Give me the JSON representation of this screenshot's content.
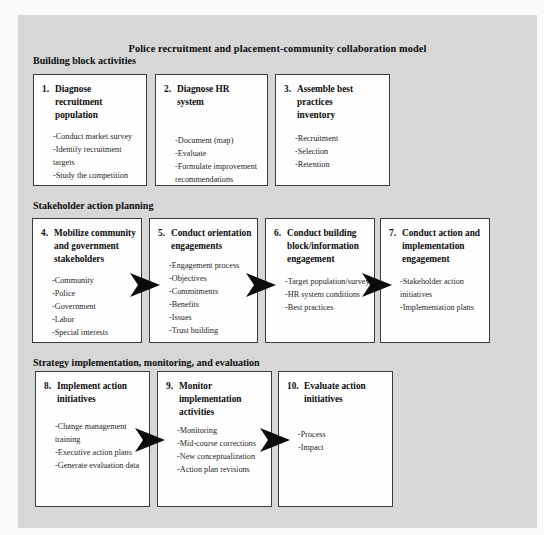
{
  "title": "Police recruitment and placement-community collaboration model",
  "colors": {
    "panel_bg": "#d7d7d7",
    "box_bg": "#fefefe",
    "border": "#3c3c3c",
    "arrow": "#0b0b0b",
    "title_text": "#0d0d0d",
    "item_text": "#1e1e1e"
  },
  "sections": [
    {
      "header": "Building block activities",
      "boxes": [
        {
          "number": "1.",
          "title": "Diagnose\nrecruitment\npopulation",
          "items": [
            "-Conduct market survey",
            "-Identify recruitment targets",
            "-Study the competition"
          ]
        },
        {
          "number": "2.",
          "title": "Diagnose HR\nsystem",
          "items": [
            "-Document (map)",
            "-Evaluate",
            "-Formulate improvement\nrecommendations"
          ]
        },
        {
          "number": "3.",
          "title": "Assemble best\npractices\ninventory",
          "items": [
            "-Recruitment",
            "-Selection",
            "-Retention"
          ]
        }
      ]
    },
    {
      "header": "Stakeholder action planning",
      "boxes": [
        {
          "number": "4.",
          "title": "Mobilize community\nand government\nstakeholders",
          "items": [
            "-Community",
            "-Police",
            "-Government",
            "-Labor",
            "-Special interests"
          ]
        },
        {
          "number": "5.",
          "title": "Conduct orientation\nengagements",
          "items": [
            "-Engagement process",
            "-Objectives",
            "-Commitments",
            "-Benefits",
            "-Issues",
            "-Trust building"
          ]
        },
        {
          "number": "6.",
          "title": "Conduct building\nblock/information\nengagement",
          "items": [
            "-Target population/survey",
            "-HR system conditions",
            "-Best practices"
          ]
        },
        {
          "number": "7.",
          "title": "Conduct action and\nimplementation\nengagement",
          "items": [
            "-Stakeholder action\ninitiatives",
            "-Implementation plans"
          ]
        }
      ]
    },
    {
      "header": "Strategy implementation, monitoring, and evaluation",
      "boxes": [
        {
          "number": "8.",
          "title": "Implement action\ninitiatives",
          "items": [
            "-Change management\ntraining",
            "-Executive action plans",
            "-Generate evaluation data"
          ]
        },
        {
          "number": "9.",
          "title": "Monitor\nimplementation\nactivities",
          "items": [
            "-Monitoring",
            "-Mid-course corrections",
            "-New conceptualization",
            "-Action plan revisions"
          ]
        },
        {
          "number": "10.",
          "title": "Evaluate action\ninitiatives",
          "items": [
            "-Process",
            "-Impact"
          ]
        }
      ]
    }
  ]
}
